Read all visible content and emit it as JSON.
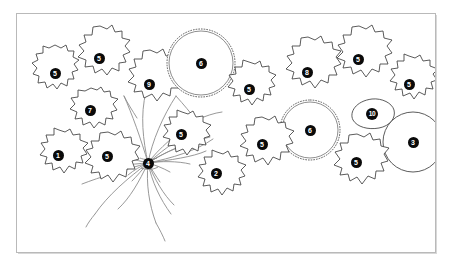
{
  "figure": {
    "frame_color": "#b9b9b9",
    "background_color": "#ffffff",
    "leaf_outline_color": "#3a3a3a",
    "stem_color": "#8a8a8a",
    "marker_fill": "#0a0a0a",
    "marker_text_color": "#ffffff"
  },
  "chart_data": {
    "type": "diagram",
    "xlabel": "",
    "ylabel": "",
    "grid": false,
    "legend": "none",
    "unit": "px",
    "canvas": {
      "width": 454,
      "height": 275
    },
    "plate_frame": {
      "x": 16,
      "y": 13,
      "width": 420,
      "height": 240
    },
    "categories": [
      "1",
      "2",
      "3",
      "4",
      "5",
      "6",
      "7",
      "8",
      "9",
      "10"
    ],
    "label_counts": {
      "1": 1,
      "2": 1,
      "3": 1,
      "4": 1,
      "5": 8,
      "6": 2,
      "7": 1,
      "8": 1,
      "9": 1,
      "10": 1
    },
    "total_markers": 18,
    "crown_node": {
      "label": "4",
      "x": 148,
      "y": 163
    },
    "markers": [
      {
        "id": "leaf-5-upper-left",
        "label": "5",
        "x": 55,
        "y": 73,
        "blade": "lobed",
        "size": "medium"
      },
      {
        "id": "leaf-5-top-left",
        "label": "5",
        "x": 99,
        "y": 58,
        "blade": "lobed",
        "size": "large"
      },
      {
        "id": "leaf-7-left",
        "label": "7",
        "x": 90,
        "y": 110,
        "blade": "lobed",
        "size": "medium"
      },
      {
        "id": "leaf-9-center-top",
        "label": "9",
        "x": 149,
        "y": 84,
        "blade": "lobed",
        "size": "large"
      },
      {
        "id": "leaf-6-top-center",
        "label": "6",
        "x": 201,
        "y": 63,
        "blade": "crenate",
        "size": "large"
      },
      {
        "id": "leaf-5-top-mid",
        "label": "5",
        "x": 249,
        "y": 89,
        "blade": "lobed",
        "size": "medium"
      },
      {
        "id": "leaf-8-top-right",
        "label": "8",
        "x": 307,
        "y": 72,
        "blade": "lobed",
        "size": "large"
      },
      {
        "id": "leaf-5-upper-right",
        "label": "5",
        "x": 358,
        "y": 59,
        "blade": "lobed",
        "size": "large"
      },
      {
        "id": "leaf-5-far-right",
        "label": "5",
        "x": 409,
        "y": 84,
        "blade": "lobed",
        "size": "medium"
      },
      {
        "id": "leaf-10-right",
        "label": "10",
        "x": 372,
        "y": 114,
        "blade": "entire",
        "size": "small"
      },
      {
        "id": "leaf-3-far-right",
        "label": "3",
        "x": 413,
        "y": 142,
        "blade": "rounded",
        "size": "large"
      },
      {
        "id": "leaf-6-mid-right",
        "label": "6",
        "x": 310,
        "y": 130,
        "blade": "crenate",
        "size": "large"
      },
      {
        "id": "leaf-5-lower-right",
        "label": "5",
        "x": 356,
        "y": 162,
        "blade": "lobed",
        "size": "medium"
      },
      {
        "id": "leaf-5-mid-right-low",
        "label": "5",
        "x": 262,
        "y": 144,
        "blade": "lobed",
        "size": "medium"
      },
      {
        "id": "leaf-5-center",
        "label": "5",
        "x": 181,
        "y": 134,
        "blade": "lobed",
        "size": "medium"
      },
      {
        "id": "leaf-2-bottom-center",
        "label": "2",
        "x": 216,
        "y": 173,
        "blade": "lobed",
        "size": "medium"
      },
      {
        "id": "leaf-4-crown",
        "label": "4",
        "x": 148,
        "y": 163,
        "blade": "crown",
        "size": "node"
      },
      {
        "id": "leaf-5-lower-left",
        "label": "5",
        "x": 107,
        "y": 156,
        "blade": "lobed",
        "size": "medium"
      },
      {
        "id": "leaf-1-far-left",
        "label": "1",
        "x": 58,
        "y": 155,
        "blade": "lobed",
        "size": "medium"
      }
    ]
  }
}
